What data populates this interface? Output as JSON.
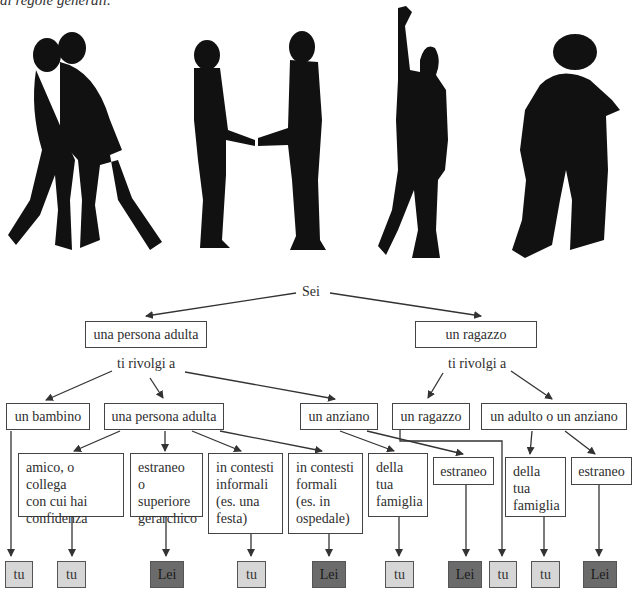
{
  "caption": "di regole generali.",
  "colors": {
    "tu": "#d6d6d6",
    "lei": "#6b6b6b",
    "line": "#333333"
  },
  "illustrations": [
    {
      "name": "two-girls-hugging-silhouette"
    },
    {
      "name": "handshake-silhouette"
    },
    {
      "name": "waving-person-silhouette"
    },
    {
      "name": "couple-hugging-silhouette"
    }
  ],
  "tree": {
    "root": "Sei",
    "level1": [
      {
        "id": "adult",
        "label": "una persona adulta"
      },
      {
        "id": "youth",
        "label": "un ragazzo"
      }
    ],
    "prompt": "ti rivolgi a",
    "level2": [
      {
        "id": "child",
        "label": "un bambino"
      },
      {
        "id": "adult2",
        "label": "una persona adulta"
      },
      {
        "id": "elder",
        "label": "un anziano"
      },
      {
        "id": "youth2",
        "label": "un ragazzo"
      },
      {
        "id": "adult_or_elder",
        "label": "un adulto o un anziano"
      }
    ],
    "level3": [
      {
        "id": "friend",
        "label": "amico, o collega\ncon cui hai\nconfidenza"
      },
      {
        "id": "stranger_sup",
        "label": "estraneo o\nsuperiore\ngerarchico"
      },
      {
        "id": "informal",
        "label": "in contesti\ninformali\n(es. una\nfesta)"
      },
      {
        "id": "formal",
        "label": "in contesti\nformali\n(es. in\nospedale)"
      },
      {
        "id": "family1",
        "label": "della\ntua\nfamiglia"
      },
      {
        "id": "stranger1",
        "label": "estraneo"
      },
      {
        "id": "family2",
        "label": "della\ntua\nfamiglia"
      },
      {
        "id": "stranger2",
        "label": "estraneo"
      }
    ],
    "answers": [
      {
        "label": "tu",
        "type": "tu"
      },
      {
        "label": "tu",
        "type": "tu"
      },
      {
        "label": "Lei",
        "type": "lei"
      },
      {
        "label": "tu",
        "type": "tu"
      },
      {
        "label": "Lei",
        "type": "lei"
      },
      {
        "label": "tu",
        "type": "tu"
      },
      {
        "label": "Lei",
        "type": "lei"
      },
      {
        "label": "tu",
        "type": "tu"
      },
      {
        "label": "tu",
        "type": "tu"
      },
      {
        "label": "Lei",
        "type": "lei"
      }
    ]
  }
}
